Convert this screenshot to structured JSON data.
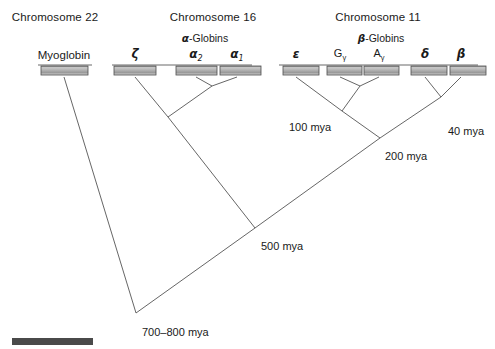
{
  "figure": {
    "background_color": "#ffffff",
    "line_color": "#555555",
    "gene_box_border": "#4d4d4d",
    "scale_bar_color": "#4a4a4a"
  },
  "chromosomes": [
    {
      "id": "chr22",
      "header": "Chromosome 22",
      "center_x": 55
    },
    {
      "id": "chr16",
      "header": "Chromosome 16",
      "center_x": 213
    },
    {
      "id": "chr11",
      "header": "Chromosome 11",
      "center_x": 378
    }
  ],
  "families": [
    {
      "id": "alpha-globins",
      "greek": "α",
      "suffix": "-Globins",
      "center_x": 205
    },
    {
      "id": "beta-globins",
      "greek": "β",
      "suffix": "-Globins",
      "center_x": 381
    }
  ],
  "genes": [
    {
      "id": "myoglobin",
      "label": "Myoglobin",
      "kind": "roman",
      "chromosome": "chr22",
      "center_x": 64
    },
    {
      "id": "zeta",
      "label": "ζ",
      "kind": "greek",
      "chromosome": "chr16",
      "center_x": 135
    },
    {
      "id": "alpha2",
      "label": "α",
      "sub": "2",
      "kind": "greek",
      "chromosome": "chr16",
      "center_x": 196
    },
    {
      "id": "alpha1",
      "label": "α",
      "sub": "1",
      "kind": "greek",
      "chromosome": "chr16",
      "center_x": 237
    },
    {
      "id": "epsilon",
      "label": "ε",
      "kind": "greek",
      "chromosome": "chr11",
      "center_x": 296
    },
    {
      "id": "g-gamma",
      "label": "G",
      "sub": "γ",
      "kind": "roman",
      "chromosome": "chr11",
      "center_x": 340
    },
    {
      "id": "a-gamma",
      "label": "A",
      "sub": "γ",
      "kind": "roman",
      "chromosome": "chr11",
      "center_x": 379
    },
    {
      "id": "delta",
      "label": "δ",
      "kind": "greek",
      "chromosome": "chr11",
      "center_x": 425
    },
    {
      "id": "beta",
      "label": "β",
      "kind": "greek",
      "chromosome": "chr11",
      "center_x": 461
    }
  ],
  "divergence_nodes": [
    {
      "id": "node-40",
      "label": "40 mya",
      "x": 441,
      "y": 97,
      "label_x": 448,
      "label_y": 126
    },
    {
      "id": "node-100",
      "label": "100 mya",
      "x": 342,
      "y": 111,
      "label_x": 289,
      "label_y": 122
    },
    {
      "id": "node-200",
      "label": "200 mya",
      "x": 380,
      "y": 138,
      "label_x": 385,
      "label_y": 151
    },
    {
      "id": "node-500",
      "label": "500 mya",
      "x": 255,
      "y": 228,
      "label_x": 261,
      "label_y": 241
    },
    {
      "id": "node-root",
      "label": "700–800 mya",
      "x": 136,
      "y": 313,
      "label_x": 142,
      "label_y": 327
    }
  ],
  "chromosome_lines": [
    {
      "id": "chr22-line",
      "x1": 38,
      "x2": 92,
      "y": 65
    },
    {
      "id": "chr16-line",
      "x1": 112,
      "x2": 252,
      "y": 65
    },
    {
      "id": "chr11-line",
      "x1": 279,
      "x2": 478,
      "y": 65
    }
  ],
  "gene_boxes": [
    {
      "id": "box-myoglobin",
      "x": 41,
      "y": 66,
      "w": 47,
      "h": 9
    },
    {
      "id": "box-zeta",
      "x": 114,
      "y": 66,
      "w": 42,
      "h": 9
    },
    {
      "id": "box-alpha2",
      "x": 176,
      "y": 66,
      "w": 41,
      "h": 9
    },
    {
      "id": "box-alpha1",
      "x": 220,
      "y": 66,
      "w": 41,
      "h": 9
    },
    {
      "id": "box-epsilon",
      "x": 283,
      "y": 66,
      "w": 36,
      "h": 9
    },
    {
      "id": "box-g-gamma",
      "x": 327,
      "y": 66,
      "w": 35,
      "h": 9
    },
    {
      "id": "box-a-gamma",
      "x": 364,
      "y": 66,
      "w": 35,
      "h": 9
    },
    {
      "id": "box-delta",
      "x": 411,
      "y": 66,
      "w": 36,
      "h": 9
    },
    {
      "id": "box-beta",
      "x": 450,
      "y": 66,
      "w": 36,
      "h": 9
    }
  ],
  "tree_branches": [
    {
      "id": "branch-myoglobin",
      "from": [
        64,
        77
      ],
      "to": [
        136,
        313
      ]
    },
    {
      "id": "branch-zeta",
      "from": [
        135,
        77
      ],
      "to": [
        168,
        117
      ]
    },
    {
      "id": "branch-alpha2",
      "from": [
        196,
        77
      ],
      "to": [
        212,
        86
      ]
    },
    {
      "id": "branch-alpha1",
      "from": [
        237,
        77
      ],
      "to": [
        212,
        86
      ]
    },
    {
      "id": "branch-alpha-pair",
      "from": [
        212,
        86
      ],
      "to": [
        168,
        117
      ]
    },
    {
      "id": "branch-alpha-stem",
      "from": [
        168,
        117
      ],
      "to": [
        255,
        228
      ]
    },
    {
      "id": "branch-epsilon",
      "from": [
        296,
        77
      ],
      "to": [
        342,
        111
      ]
    },
    {
      "id": "branch-g-gamma",
      "from": [
        340,
        77
      ],
      "to": [
        360,
        86
      ]
    },
    {
      "id": "branch-a-gamma",
      "from": [
        379,
        77
      ],
      "to": [
        360,
        86
      ]
    },
    {
      "id": "branch-gamma-pair",
      "from": [
        360,
        86
      ],
      "to": [
        342,
        111
      ]
    },
    {
      "id": "branch-eg-stem",
      "from": [
        342,
        111
      ],
      "to": [
        380,
        138
      ]
    },
    {
      "id": "branch-delta",
      "from": [
        425,
        77
      ],
      "to": [
        441,
        97
      ]
    },
    {
      "id": "branch-beta",
      "from": [
        461,
        77
      ],
      "to": [
        441,
        97
      ]
    },
    {
      "id": "branch-db-stem",
      "from": [
        441,
        97
      ],
      "to": [
        380,
        138
      ]
    },
    {
      "id": "branch-beta-family-stem",
      "from": [
        380,
        138
      ],
      "to": [
        255,
        228
      ]
    },
    {
      "id": "branch-root",
      "from": [
        255,
        228
      ],
      "to": [
        136,
        313
      ]
    }
  ],
  "scale_bar": {
    "id": "scale-bar",
    "x": 12,
    "y": 338,
    "w": 81,
    "h": 7
  }
}
